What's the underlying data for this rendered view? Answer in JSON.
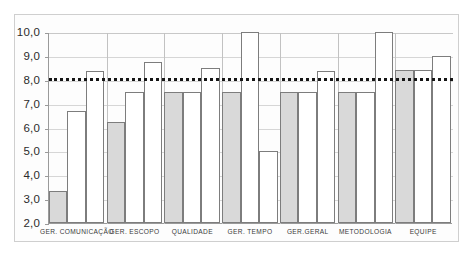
{
  "chart_data": {
    "type": "bar",
    "title": "",
    "subtitle": "",
    "xlabel": "",
    "ylabel": "",
    "ylim": [
      2.0,
      10.0
    ],
    "ytick_labels": [
      "10,0",
      "9,0",
      "8,0",
      "7,0",
      "6,0",
      "5,0",
      "4,0",
      "3,0",
      "2,0"
    ],
    "ytick_values": [
      10.0,
      9.0,
      8.0,
      7.0,
      6.0,
      5.0,
      4.0,
      3.0,
      2.0
    ],
    "grid": true,
    "legend": "none",
    "decimal_separator": ",",
    "categories": [
      "GER. COMUNICAÇÃO",
      "GER. ESCOPO",
      "QUALIDADE",
      "GER. TEMPO",
      "GER.GERAL",
      "METODOLOGIA",
      "EQUIPE"
    ],
    "series": [
      {
        "name": "serie-1",
        "fill": "#d9d9d9",
        "values": [
          3.35,
          6.25,
          7.5,
          7.5,
          7.5,
          7.5,
          8.4
        ]
      },
      {
        "name": "serie-2",
        "fill": "#ffffff",
        "values": [
          6.7,
          7.5,
          7.5,
          10.0,
          7.5,
          7.5,
          8.4
        ]
      },
      {
        "name": "serie-3",
        "fill": "#ffffff",
        "values": [
          8.35,
          8.75,
          8.5,
          5.0,
          8.35,
          10.0,
          9.0
        ]
      }
    ],
    "annotations": [
      {
        "name": "reference-line",
        "type": "horizontal-dotted-line",
        "value": 8.1,
        "color": "#161616"
      }
    ]
  },
  "colors": {
    "bar_gray": "#d9d9d9",
    "bar_white": "#ffffff",
    "bar_border": "#7d7d7d",
    "grid": "#d6d6d6",
    "axis": "#9a9a9a",
    "frame": "#cfcfcf",
    "reference_line": "#161616",
    "text": "#2b2b2b"
  }
}
